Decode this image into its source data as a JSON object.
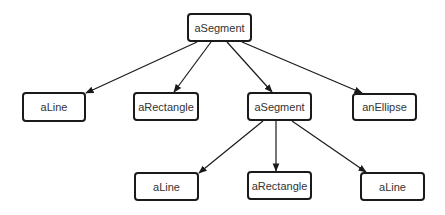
{
  "diagram": {
    "type": "tree",
    "nodes": [
      {
        "id": "root",
        "label": "aSegment"
      },
      {
        "id": "line1",
        "label": "aLine"
      },
      {
        "id": "rect1",
        "label": "aRectangle"
      },
      {
        "id": "seg2",
        "label": "aSegment"
      },
      {
        "id": "ellipse1",
        "label": "anEllipse"
      },
      {
        "id": "line2",
        "label": "aLine"
      },
      {
        "id": "rect2",
        "label": "aRectangle"
      },
      {
        "id": "line3",
        "label": "aLine"
      }
    ],
    "edges": [
      {
        "from": "root",
        "to": "line1"
      },
      {
        "from": "root",
        "to": "rect1"
      },
      {
        "from": "root",
        "to": "seg2"
      },
      {
        "from": "root",
        "to": "ellipse1"
      },
      {
        "from": "seg2",
        "to": "line2"
      },
      {
        "from": "seg2",
        "to": "rect2"
      },
      {
        "from": "seg2",
        "to": "line3"
      }
    ],
    "colors": {
      "stroke": "#1a1a1a",
      "text": "#333333",
      "background": "#ffffff"
    }
  }
}
